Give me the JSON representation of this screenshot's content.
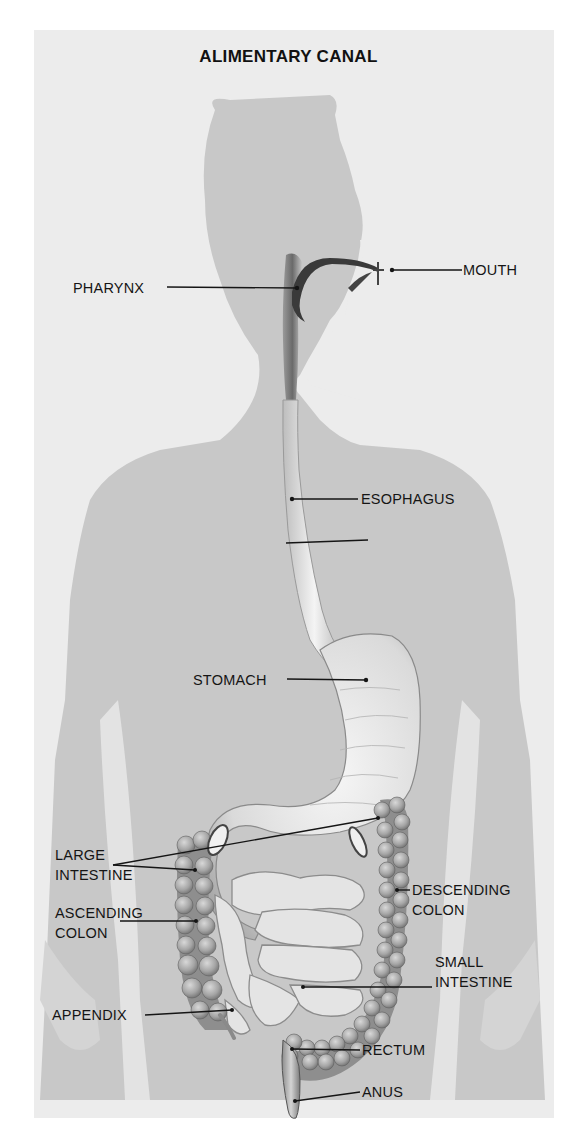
{
  "diagram": {
    "title": "ALIMENTARY CANAL",
    "colors": {
      "background": "#ececec",
      "silhouette": "#c6c6c6",
      "organ_light": "#e2e2e2",
      "organ_dark": "#7a7a7a",
      "label_text": "#151515"
    },
    "labels": {
      "pharynx": "PHARYNX",
      "mouth": "MOUTH",
      "esophagus": "ESOPHAGUS",
      "stomach": "STOMACH",
      "large_intestine_1": "LARGE",
      "large_intestine_2": "INTESTINE",
      "ascending_colon_1": "ASCENDING",
      "ascending_colon_2": "COLON",
      "descending_colon_1": "DESCENDING",
      "descending_colon_2": "COLON",
      "small_intestine_1": "SMALL",
      "small_intestine_2": "INTESTINE",
      "appendix": "APPENDIX",
      "rectum": "RECTUM",
      "anus": "ANUS"
    }
  }
}
